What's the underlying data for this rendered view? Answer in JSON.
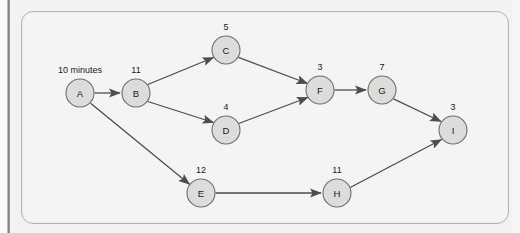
{
  "figure": {
    "kind": "activity-network-diagram",
    "panel_background": "#f4f4f4",
    "page_background": "#f2f2f2",
    "node_fill": "#dcdcdc",
    "node_stroke": "#6e6e6e",
    "edge_color": "#4d4d4d"
  },
  "nodes": [
    {
      "id": "A",
      "label": "A",
      "duration": "10 minutes",
      "duration_wide": true,
      "cx": 80,
      "cy": 93,
      "r": 14
    },
    {
      "id": "B",
      "label": "B",
      "duration": "11",
      "duration_wide": false,
      "cx": 136,
      "cy": 93,
      "r": 14
    },
    {
      "id": "C",
      "label": "C",
      "duration": "5",
      "duration_wide": false,
      "cx": 226,
      "cy": 50,
      "r": 14
    },
    {
      "id": "D",
      "label": "D",
      "duration": "4",
      "duration_wide": false,
      "cx": 226,
      "cy": 130,
      "r": 14
    },
    {
      "id": "E",
      "label": "E",
      "duration": "12",
      "duration_wide": false,
      "cx": 201,
      "cy": 193,
      "r": 14
    },
    {
      "id": "F",
      "label": "F",
      "duration": "3",
      "duration_wide": false,
      "cx": 320,
      "cy": 90,
      "r": 14
    },
    {
      "id": "G",
      "label": "G",
      "duration": "7",
      "duration_wide": false,
      "cx": 382,
      "cy": 90,
      "r": 14
    },
    {
      "id": "H",
      "label": "H",
      "duration": "11",
      "duration_wide": false,
      "cx": 337,
      "cy": 193,
      "r": 14
    },
    {
      "id": "I",
      "label": "I",
      "duration": "3",
      "duration_wide": false,
      "cx": 453,
      "cy": 130,
      "r": 14
    }
  ],
  "edges": [
    {
      "from": "A",
      "to": "B"
    },
    {
      "from": "A",
      "to": "E"
    },
    {
      "from": "B",
      "to": "C"
    },
    {
      "from": "B",
      "to": "D"
    },
    {
      "from": "C",
      "to": "F"
    },
    {
      "from": "D",
      "to": "F"
    },
    {
      "from": "F",
      "to": "G"
    },
    {
      "from": "G",
      "to": "I"
    },
    {
      "from": "E",
      "to": "H"
    },
    {
      "from": "H",
      "to": "I"
    }
  ],
  "labels": {
    "node_A": "A",
    "node_B": "B",
    "node_C": "C",
    "node_D": "D",
    "node_E": "E",
    "node_F": "F",
    "node_G": "G",
    "node_H": "H",
    "node_I": "I",
    "dur_A": "10 minutes",
    "dur_B": "11",
    "dur_C": "5",
    "dur_D": "4",
    "dur_E": "12",
    "dur_F": "3",
    "dur_G": "7",
    "dur_H": "11",
    "dur_I": "3"
  }
}
